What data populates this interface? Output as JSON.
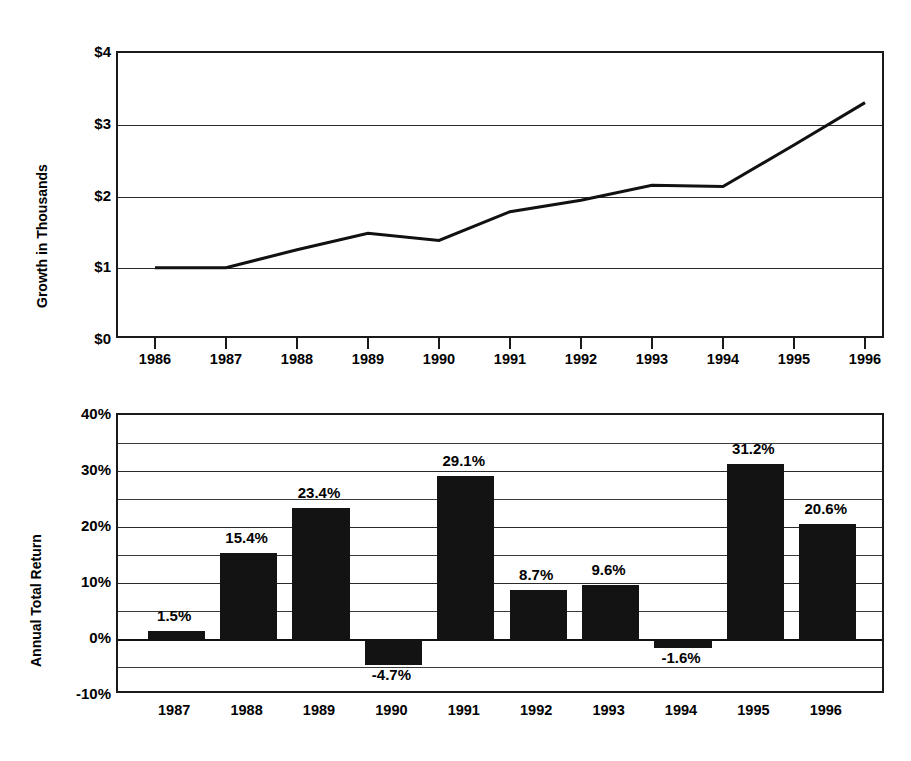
{
  "chart_data": [
    {
      "id": "growth-line-chart",
      "type": "line",
      "title": "",
      "xlabel": "",
      "ylabel": "Growth in Thousands",
      "x": [
        1986,
        1987,
        1988,
        1989,
        1990,
        1991,
        1992,
        1993,
        1994,
        1995,
        1996
      ],
      "xticklabels": [
        "1986",
        "1987",
        "1988",
        "1989",
        "1990",
        "1991",
        "1992",
        "1993",
        "1994",
        "1995",
        "1996"
      ],
      "values": [
        0.98,
        0.98,
        1.23,
        1.46,
        1.36,
        1.76,
        1.92,
        2.13,
        2.11,
        2.69,
        3.28
      ],
      "ylim": [
        0,
        4
      ],
      "yticks": [
        0,
        1,
        2,
        3,
        4
      ],
      "yticklabels": [
        "$0",
        "$1",
        "$2",
        "$3",
        "$4"
      ],
      "grid": "horizontal-major",
      "legend": "none",
      "line_color": "#111111"
    },
    {
      "id": "annual-total-return-bar-chart",
      "type": "bar",
      "title": "",
      "xlabel": "",
      "ylabel": "Annual Total Return",
      "categories": [
        "1987",
        "1988",
        "1989",
        "1990",
        "1991",
        "1992",
        "1993",
        "1994",
        "1995",
        "1996"
      ],
      "values": [
        1.5,
        15.4,
        23.4,
        -4.7,
        29.1,
        8.7,
        9.6,
        -1.6,
        31.2,
        20.6
      ],
      "datalabels": [
        "1.5%",
        "15.4%",
        "23.4%",
        "-4.7%",
        "29.1%",
        "8.7%",
        "9.6%",
        "-1.6%",
        "31.2%",
        "20.6%"
      ],
      "ylim": [
        -10,
        40
      ],
      "yticks": [
        -10,
        0,
        10,
        20,
        30,
        40
      ],
      "yticklabels": [
        "-10%",
        "0%",
        "10%",
        "20%",
        "30%",
        "40%"
      ],
      "minor_yticks": [
        -5,
        5,
        15,
        25,
        35
      ],
      "grid": "horizontal-major-and-minor",
      "legend": "none",
      "bar_color": "#131313"
    }
  ],
  "line_chart": {
    "ylabel": "Growth in Thousands",
    "yticklabels": [
      "$4",
      "$3",
      "$2",
      "$1",
      "$0"
    ],
    "xticklabels": [
      "1986",
      "1987",
      "1988",
      "1989",
      "1990",
      "1991",
      "1992",
      "1993",
      "1994",
      "1995",
      "1996"
    ]
  },
  "bar_chart": {
    "ylabel": "Annual Total Return",
    "yticklabels": [
      "40%",
      "30%",
      "20%",
      "10%",
      "0%",
      "-10%"
    ],
    "xticklabels": [
      "1987",
      "1988",
      "1989",
      "1990",
      "1991",
      "1992",
      "1993",
      "1994",
      "1995",
      "1996"
    ],
    "datalabels": [
      "1.5%",
      "15.4%",
      "23.4%",
      "-4.7%",
      "29.1%",
      "8.7%",
      "9.6%",
      "-1.6%",
      "31.2%",
      "20.6%"
    ]
  }
}
